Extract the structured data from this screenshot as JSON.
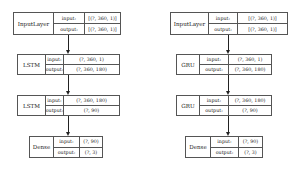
{
  "diagrams": [
    {
      "name": "lstm-model",
      "nodes": [
        {
          "layer": "InputLayer",
          "input_label": "input:",
          "input": "[(?, 360, 1)]",
          "output_label": "output:",
          "output": "[(?, 360, 1)]"
        },
        {
          "layer": "LSTM",
          "input_label": "input:",
          "input": "(?, 360, 1)",
          "output_label": "output:",
          "output": "(?, 360, 180)"
        },
        {
          "layer": "LSTM",
          "input_label": "input:",
          "input": "(?, 360, 180)",
          "output_label": "output:",
          "output": "(?, 90)"
        },
        {
          "layer": "Dense",
          "input_label": "input:",
          "input": "(?, 90)",
          "output_label": "output:",
          "output": "(?, 3)"
        }
      ]
    },
    {
      "name": "gru-model",
      "nodes": [
        {
          "layer": "InputLayer",
          "input_label": "input:",
          "input": "[(?, 360, 1)]",
          "output_label": "output:",
          "output": "[(?, 360, 1)]"
        },
        {
          "layer": "GRU",
          "input_label": "input:",
          "input": "(?, 360, 1)",
          "output_label": "output:",
          "output": "(?, 360, 180)"
        },
        {
          "layer": "GRU",
          "input_label": "input:",
          "input": "(?, 360, 180)",
          "output_label": "output:",
          "output": "(?, 90)"
        },
        {
          "layer": "Dense",
          "input_label": "input:",
          "input": "(?, 90)",
          "output_label": "output:",
          "output": "(?, 3)"
        }
      ]
    }
  ],
  "colors": {
    "border": "#555555",
    "edge": "#222222",
    "background": "#ffffff"
  }
}
